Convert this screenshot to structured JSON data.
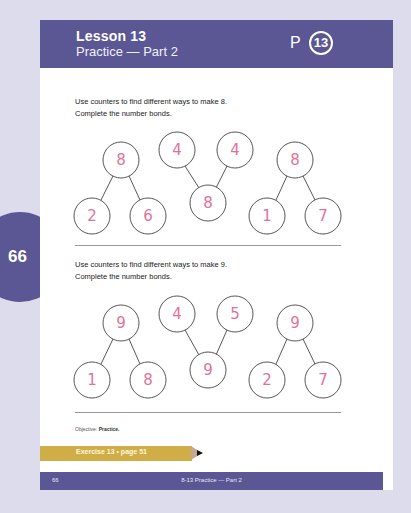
{
  "header": {
    "lesson": "Lesson 13",
    "subtitle": "Practice — Part 2",
    "p_label": "P",
    "p_number": "13"
  },
  "side_tab": {
    "page_number": "66"
  },
  "sections": [
    {
      "instruction_1": "Use counters to find different ways to make 8.",
      "instruction_2": "Complete the number bonds.",
      "bonds": [
        {
          "whole": "8",
          "part_a": "2",
          "part_b": "6",
          "orientation": "whole-top"
        },
        {
          "whole": "8",
          "part_a": "4",
          "part_b": "4",
          "orientation": "whole-bottom"
        },
        {
          "whole": "8",
          "part_a": "1",
          "part_b": "7",
          "orientation": "whole-top"
        }
      ]
    },
    {
      "instruction_1": "Use counters to find different ways to make 9.",
      "instruction_2": "Complete the number bonds.",
      "bonds": [
        {
          "whole": "9",
          "part_a": "1",
          "part_b": "8",
          "orientation": "whole-top"
        },
        {
          "whole": "9",
          "part_a": "4",
          "part_b": "5",
          "orientation": "whole-bottom"
        },
        {
          "whole": "9",
          "part_a": "2",
          "part_b": "7",
          "orientation": "whole-top"
        }
      ]
    }
  ],
  "objective": {
    "label": "Objective:",
    "value": "Practice."
  },
  "exercise_banner": "Exercise 13 • page 51",
  "footer": {
    "page_number": "66",
    "title": "8-13  Practice — Part 2"
  },
  "colors": {
    "brand_purple": "#5b5795",
    "background": "#dddcec",
    "handwriting_pink": "#e0739b",
    "pencil_gold": "#cfae48"
  }
}
